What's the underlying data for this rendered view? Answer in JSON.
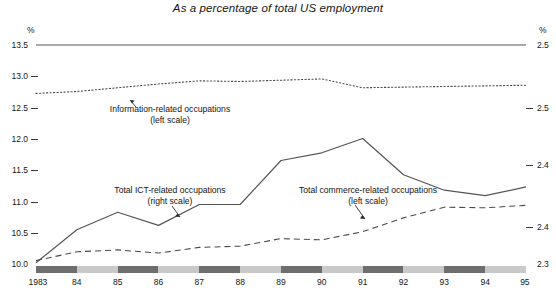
{
  "chart_data": {
    "type": "line",
    "title": "As a percentage of total US employment",
    "xlabel": "",
    "ylabel": "%",
    "y2label": "%",
    "grid": false,
    "legend_position": "inline-annotations",
    "x": [
      1983,
      1984,
      1985,
      1986,
      1987,
      1988,
      1989,
      1990,
      1991,
      1992,
      1993,
      1994,
      1995
    ],
    "xtick_labels": [
      "1983",
      "84",
      "85",
      "86",
      "87",
      "88",
      "89",
      "90",
      "91",
      "92",
      "93",
      "94",
      "95"
    ],
    "ylim": [
      10.0,
      13.5
    ],
    "ytick_labels": [
      "13.5",
      "13.0",
      "12.5",
      "12.0",
      "11.5",
      "11.0",
      "10.5",
      "10.0"
    ],
    "ytick_values": [
      13.5,
      13.0,
      12.5,
      12.0,
      11.5,
      11.0,
      10.5,
      10.0
    ],
    "y2lim": [
      2.35,
      2.55
    ],
    "y2tick_labels": [
      "2.5",
      "2.5",
      "2.4",
      "2.4",
      "2.3"
    ],
    "y2tick_values": [
      2.55,
      2.5,
      2.45,
      2.4,
      2.35
    ],
    "series": [
      {
        "name": "Information-related occupations",
        "scale": "left",
        "scale_note": "(left scale)",
        "style": "dotted",
        "color": "#4a4a4a",
        "values": [
          12.73,
          12.76,
          12.82,
          12.88,
          12.93,
          12.92,
          12.94,
          12.96,
          12.82,
          12.83,
          12.84,
          12.85,
          12.86
        ]
      },
      {
        "name": "Total ICT-related occupations",
        "scale": "right",
        "scale_note": "(right scale)",
        "style": "solid",
        "color": "#555555",
        "values": [
          2.352,
          2.382,
          2.398,
          2.386,
          2.405,
          2.405,
          2.445,
          2.452,
          2.465,
          2.432,
          2.418,
          2.413,
          2.421
        ]
      },
      {
        "name": "Total commerce-related occupations",
        "scale": "left",
        "scale_note": "(left scale)",
        "style": "dashed",
        "color": "#4a4a4a",
        "values": [
          10.07,
          10.21,
          10.24,
          10.19,
          10.28,
          10.3,
          10.42,
          10.4,
          10.53,
          10.75,
          10.92,
          10.91,
          10.95
        ]
      }
    ]
  },
  "axes": {
    "left_unit": "%",
    "right_unit": "%"
  },
  "annotations": [
    {
      "id": "information-related",
      "label": "Information-related occupations",
      "scale_note": "(left scale)"
    },
    {
      "id": "total-ict-related",
      "label": "Total ICT-related occupations",
      "scale_note": "(right scale)"
    },
    {
      "id": "total-commerce-related",
      "label": "Total commerce-related occupations",
      "scale_note": "(left scale)"
    }
  ],
  "colors": {
    "line": "#555555",
    "text": "#161616",
    "band_dark": "#6e6e6e",
    "band_light": "#c9c9c9"
  }
}
